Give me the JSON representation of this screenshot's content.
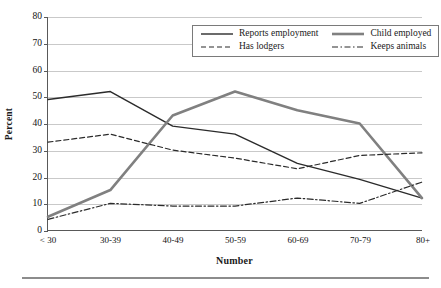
{
  "chart_data": {
    "type": "line",
    "title": "",
    "xlabel": "Number",
    "ylabel": "Percent",
    "categories": [
      "< 30",
      "30-39",
      "40-49",
      "50-59",
      "60-69",
      "70-79",
      "80+"
    ],
    "ylim": [
      0,
      80
    ],
    "yticks": [
      0,
      10,
      20,
      30,
      40,
      50,
      60,
      70,
      80
    ],
    "grid": true,
    "legend_position": "top-right",
    "series": [
      {
        "name": "Reports employment",
        "style": "solid",
        "color": "#2b2b2b",
        "width": 1.4,
        "values": [
          49,
          52,
          39,
          36,
          25,
          19,
          12
        ]
      },
      {
        "name": "Child employed",
        "style": "solid",
        "color": "#808080",
        "width": 2.6,
        "values": [
          5,
          15,
          43,
          52,
          45,
          40,
          12
        ]
      },
      {
        "name": "Has lodgers",
        "style": "dashed",
        "color": "#2b2b2b",
        "width": 1.2,
        "values": [
          33,
          36,
          30,
          27,
          23,
          28,
          29
        ]
      },
      {
        "name": "Keeps animals",
        "style": "dashdot",
        "color": "#2b2b2b",
        "width": 1.2,
        "values": [
          4,
          10,
          9,
          9,
          12,
          10,
          18
        ]
      }
    ]
  },
  "axis": {
    "y_title": "Percent",
    "x_title": "Number"
  },
  "legend": {
    "items": [
      {
        "label": "Reports employment",
        "swatch": "solid-dark-line-icon"
      },
      {
        "label": "Child employed",
        "swatch": "solid-gray-thick-line-icon"
      },
      {
        "label": "Has lodgers",
        "swatch": "dashed-line-icon"
      },
      {
        "label": "Keeps animals",
        "swatch": "dashdot-line-icon"
      }
    ]
  },
  "colors": {
    "grid": "#c9c9c9",
    "axis": "#595959",
    "dark_series": "#2b2b2b",
    "gray_series": "#808080",
    "rule": "#8c8c8c"
  }
}
